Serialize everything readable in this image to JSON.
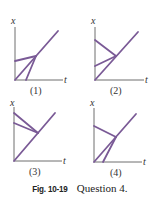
{
  "figure": {
    "caption_label": "Fig. 10-19",
    "caption_text": "Question 4.",
    "axis_labels": {
      "y": "x",
      "x": "t"
    },
    "line_color": "#7a5a96",
    "panels": [
      {
        "label": "(1)",
        "origin": [
          15,
          80
        ],
        "y_top": 27,
        "x_end": 63,
        "lines": [
          [
            [
              15,
              80
            ],
            [
              58,
              31
            ]
          ],
          [
            [
              15,
              61
            ],
            [
              36,
              56
            ]
          ],
          [
            [
              26,
              80
            ],
            [
              36,
              56
            ]
          ]
        ]
      },
      {
        "label": "(2)",
        "origin": [
          95,
          80
        ],
        "y_top": 27,
        "x_end": 144,
        "lines": [
          [
            [
              95,
              80
            ],
            [
              138,
              32
            ]
          ],
          [
            [
              95,
              40
            ],
            [
              116,
              56
            ]
          ],
          [
            [
              95,
              66
            ],
            [
              116,
              56
            ]
          ]
        ]
      },
      {
        "label": "(3)",
        "origin": [
          14,
          161
        ],
        "y_top": 107,
        "x_end": 62,
        "lines": [
          [
            [
              14,
              161
            ],
            [
              55,
              113
            ]
          ],
          [
            [
              14,
              113
            ],
            [
              38,
              133
            ]
          ],
          [
            [
              14,
              123
            ],
            [
              38,
              133
            ]
          ]
        ]
      },
      {
        "label": "(4)",
        "origin": [
          94,
          162
        ],
        "y_top": 108,
        "x_end": 142,
        "lines": [
          [
            [
              94,
              162
            ],
            [
              136,
              114
            ]
          ],
          [
            [
              94,
              126
            ],
            [
              116,
              137
            ]
          ],
          [
            [
              103,
              162
            ],
            [
              116,
              137
            ]
          ]
        ]
      }
    ]
  }
}
